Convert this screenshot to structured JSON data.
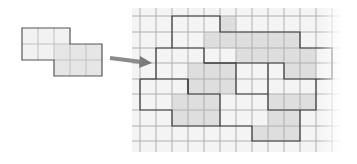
{
  "figure": {
    "cell_size": 16,
    "colors": {
      "background": "#ffffff",
      "grid_line": "#a8a8a8",
      "outline": "#3a3a3a",
      "tile_light": "#f3f3f3",
      "tile_dark": "#dcdcdc",
      "arrow": "#8a8a8a"
    }
  },
  "source_tile": {
    "origin": [
      22,
      28
    ],
    "cells": [
      [
        0,
        0
      ],
      [
        1,
        0
      ],
      [
        2,
        0
      ],
      [
        0,
        1
      ],
      [
        1,
        1
      ],
      [
        2,
        1
      ],
      [
        3,
        1
      ],
      [
        4,
        1
      ],
      [
        2,
        2
      ],
      [
        3,
        2
      ],
      [
        4,
        2
      ]
    ]
  },
  "arrow": {
    "from": [
      108,
      60
    ],
    "to": [
      150,
      63
    ]
  },
  "tiling_grid": {
    "origin": [
      140,
      16
    ],
    "cols": 12,
    "rows": 8
  }
}
